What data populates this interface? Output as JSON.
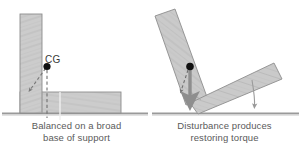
{
  "figure": {
    "type": "physics-illustration",
    "background_color": "#ffffff",
    "wood_fill": "#cccccc",
    "wood_stroke": "#8a8a8a",
    "ground_color": "#9a9a9a",
    "cg_dot_color": "#111111",
    "arrow_gray": "#8e8e8e",
    "dashed_color": "#707070",
    "caption_color": "#5a5a5a"
  },
  "labels": {
    "cg": "CG"
  },
  "panels": [
    {
      "id": "balanced",
      "caption_lines": [
        "Balanced on a broad",
        "base of support"
      ],
      "description": "Upright L-shaped block resting flat on the ground, CG over the base"
    },
    {
      "id": "disturbed",
      "caption_lines": [
        "Disturbance produces",
        "restoring torque"
      ],
      "description": "Tilted L-shaped block, weight vector creates a torque that rotates it back"
    }
  ],
  "top_cut_text": "",
  "icons": {
    "cg_marker": "filled-circle-dot",
    "weight_arrow": "down-arrow",
    "support_arrow": "down-arrow",
    "pivot_line": "dashed-line"
  }
}
